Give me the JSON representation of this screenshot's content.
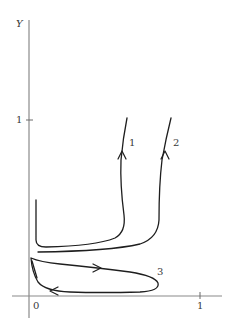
{
  "figure": {
    "y_axis_label": "Y",
    "y_tick_labels": [
      "1"
    ],
    "x_tick_labels": [
      "0",
      "1"
    ],
    "trajectory_labels": [
      "1",
      "2",
      "3"
    ]
  },
  "trajectories": [
    {
      "label": "1",
      "description": "Rises vertically near the Y axis, runs right along low Y, then rises steeply upward with an upward arrow"
    },
    {
      "label": "2",
      "description": "Runs right along low Y just below curve 1, then rises steeply upward with an upward arrow"
    },
    {
      "label": "3",
      "description": "Closed loop near the X axis traversed clockwise: rightward along the top, leftward along the bottom"
    }
  ],
  "colors": {
    "axis": "#8a8a8a",
    "curve": "#1e1e1e",
    "text": "#3a3a3a"
  }
}
